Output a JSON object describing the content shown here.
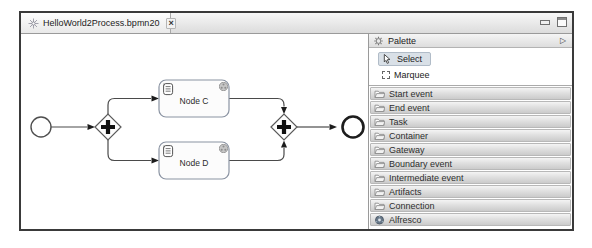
{
  "editor_tab": {
    "title": "HelloWorld2Process.bpmn20",
    "close_glyph": "×"
  },
  "window_controls": {
    "minimize_icon": "minimize",
    "maximize_icon": "maximize"
  },
  "diagram": {
    "start_event": {
      "type": "start-event"
    },
    "end_event": {
      "type": "end-event"
    },
    "gateways": [
      {
        "type": "parallel-gateway"
      },
      {
        "type": "parallel-gateway"
      }
    ],
    "tasks": [
      {
        "label": "Node C"
      },
      {
        "label": "Node D"
      }
    ]
  },
  "palette": {
    "title": "Palette",
    "collapse_glyph": "▷",
    "tools": [
      {
        "label": "Select",
        "selected": true
      },
      {
        "label": "Marquee",
        "selected": false
      }
    ],
    "drawers": [
      {
        "label": "Start event",
        "icon": "folder"
      },
      {
        "label": "End event",
        "icon": "folder"
      },
      {
        "label": "Task",
        "icon": "folder"
      },
      {
        "label": "Container",
        "icon": "folder"
      },
      {
        "label": "Gateway",
        "icon": "folder"
      },
      {
        "label": "Boundary event",
        "icon": "folder"
      },
      {
        "label": "Intermediate event",
        "icon": "folder"
      },
      {
        "label": "Artifacts",
        "icon": "folder"
      },
      {
        "label": "Connection",
        "icon": "folder"
      },
      {
        "label": "Alfresco",
        "icon": "alfresco"
      }
    ]
  },
  "colors": {
    "window_border": "#3a3a3a",
    "diagram_stroke": "#4a4a4a",
    "task_border": "#8a93a2",
    "select_highlight": "#d9e0e7",
    "drawer_top": "#f4f4f4",
    "drawer_bottom": "#cbcbcb"
  }
}
